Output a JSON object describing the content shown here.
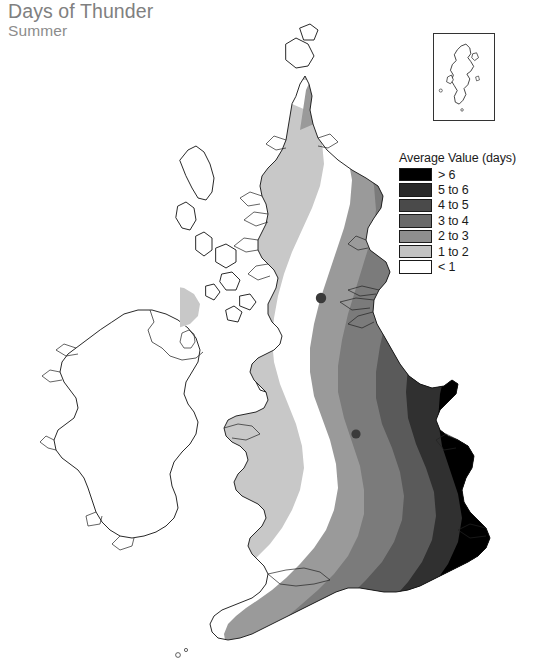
{
  "header": {
    "title": "Days of Thunder",
    "subtitle": "Summer"
  },
  "legend": {
    "title": "Average Value (days)",
    "items": [
      {
        "label": "> 6",
        "color": "#000000",
        "min": 6,
        "max": null
      },
      {
        "label": "5 to 6",
        "color": "#2b2b2b",
        "min": 5,
        "max": 6
      },
      {
        "label": "4 to 5",
        "color": "#4a4a4a",
        "min": 4,
        "max": 5
      },
      {
        "label": "3 to 4",
        "color": "#6a6a6a",
        "min": 3,
        "max": 4
      },
      {
        "label": "2 to 3",
        "color": "#8e8e8e",
        "min": 2,
        "max": 3
      },
      {
        "label": "1 to 2",
        "color": "#c2c2c2",
        "min": 1,
        "max": 2
      },
      {
        "label": "< 1",
        "color": "#ffffff",
        "min": null,
        "max": 1
      }
    ]
  },
  "inset": {
    "name": "shetland-islands-inset"
  },
  "chart_data": {
    "type": "map",
    "title": "Days of Thunder",
    "subtitle": "Summer",
    "region": "British Isles",
    "variable": "Average number of days of thunder",
    "units": "days",
    "legend_title": "Average Value (days)",
    "classes": [
      {
        "label": "> 6",
        "color": "#000000"
      },
      {
        "label": "5 to 6",
        "color": "#2b2b2b"
      },
      {
        "label": "4 to 5",
        "color": "#4a4a4a"
      },
      {
        "label": "3 to 4",
        "color": "#6a6a6a"
      },
      {
        "label": "2 to 3",
        "color": "#8e8e8e"
      },
      {
        "label": "1 to 2",
        "color": "#c2c2c2"
      },
      {
        "label": "< 1",
        "color": "#ffffff"
      }
    ],
    "spatial_pattern": "Values increase from north-west to south-east. Northern Scotland, the Hebrides and Shetland are below 1 day; Ireland, the Isle of Man and western Scotland are 1 to 2 days; eastern Scotland and Wales are 2 to 4 days; central and eastern England rise through 4 to 6 days; south-east England and East Anglia exceed 6 days.",
    "regions": [
      {
        "name": "Shetland Islands",
        "class": "< 1"
      },
      {
        "name": "Outer Hebrides",
        "class": "< 1"
      },
      {
        "name": "Northern Scotland",
        "class": "< 1"
      },
      {
        "name": "Western Scotland",
        "class": "1 to 2"
      },
      {
        "name": "Central Scotland",
        "class": "1 to 2"
      },
      {
        "name": "Eastern Scotland",
        "class": "2 to 3"
      },
      {
        "name": "Ireland",
        "class": "1 to 2"
      },
      {
        "name": "Northern Ireland",
        "class": "1 to 2"
      },
      {
        "name": "Isle of Man",
        "class": "1 to 2"
      },
      {
        "name": "North West England",
        "class": "2 to 3"
      },
      {
        "name": "North East England",
        "class": "4 to 5"
      },
      {
        "name": "Western Wales",
        "class": "2 to 3"
      },
      {
        "name": "Eastern Wales",
        "class": "3 to 4"
      },
      {
        "name": "Midlands",
        "class": "4 to 5"
      },
      {
        "name": "East Anglia",
        "class": "> 6"
      },
      {
        "name": "South East England",
        "class": "> 6"
      },
      {
        "name": "South West England",
        "class": "2 to 3"
      },
      {
        "name": "Cornwall",
        "class": "2 to 3"
      }
    ]
  }
}
